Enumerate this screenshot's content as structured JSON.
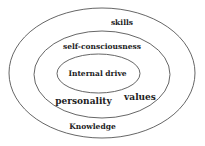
{
  "diagram": {
    "type": "concentric-ellipses",
    "stroke_color": "#555555",
    "text_color": "#222222",
    "layers": [
      {
        "name": "outer",
        "labels": [
          "skills",
          "Knowledge"
        ]
      },
      {
        "name": "middle",
        "labels": [
          "self-consciousness",
          "personality",
          "values"
        ]
      },
      {
        "name": "inner",
        "labels": [
          "Internal drive"
        ]
      }
    ],
    "labels": {
      "skills": "skills",
      "self_consciousness": "self-consciousness",
      "internal_drive": "Internal drive",
      "personality": "personality",
      "values": "values",
      "knowledge": "Knowledge"
    }
  }
}
